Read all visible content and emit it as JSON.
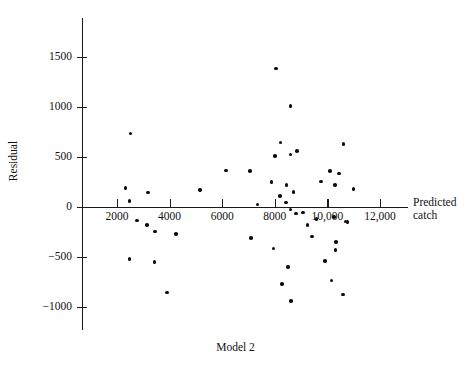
{
  "chart_data": {
    "type": "scatter",
    "title": "Model 2",
    "xlabel_line1": "Predicted",
    "xlabel_line2": "catch",
    "ylabel": "Residual",
    "xlim": [
      500,
      13000
    ],
    "ylim": [
      -1250,
      1700
    ],
    "grid": false,
    "legend": null,
    "xticks": [
      2000,
      4000,
      6000,
      8000,
      10000,
      12000
    ],
    "xtick_labels": [
      "2000",
      "4000",
      "6000",
      "8000",
      "10,000",
      "12,000"
    ],
    "yticks": [
      1500,
      1000,
      500,
      0,
      -500,
      -1000
    ],
    "ytick_labels": [
      "1500",
      "1000",
      "500",
      "0",
      "−500",
      "−1000"
    ],
    "points": [
      {
        "x": 2520,
        "y": 730
      },
      {
        "x": 2320,
        "y": 185
      },
      {
        "x": 2480,
        "y": 55
      },
      {
        "x": 3180,
        "y": 140
      },
      {
        "x": 5150,
        "y": 165
      },
      {
        "x": 2760,
        "y": -140
      },
      {
        "x": 3140,
        "y": -185
      },
      {
        "x": 3450,
        "y": -250
      },
      {
        "x": 4240,
        "y": -275
      },
      {
        "x": 2480,
        "y": -525
      },
      {
        "x": 3420,
        "y": -555
      },
      {
        "x": 3900,
        "y": -860
      },
      {
        "x": 6150,
        "y": 360
      },
      {
        "x": 7050,
        "y": 355
      },
      {
        "x": 7350,
        "y": 20
      },
      {
        "x": 7100,
        "y": -315
      },
      {
        "x": 8050,
        "y": 1380
      },
      {
        "x": 8600,
        "y": 1005
      },
      {
        "x": 8220,
        "y": 640
      },
      {
        "x": 8000,
        "y": 505
      },
      {
        "x": 8600,
        "y": 520
      },
      {
        "x": 8850,
        "y": 555
      },
      {
        "x": 7880,
        "y": 245
      },
      {
        "x": 8450,
        "y": 215
      },
      {
        "x": 8720,
        "y": 145
      },
      {
        "x": 8200,
        "y": 105
      },
      {
        "x": 8420,
        "y": 40
      },
      {
        "x": 8600,
        "y": -30
      },
      {
        "x": 8800,
        "y": -70
      },
      {
        "x": 7950,
        "y": -420
      },
      {
        "x": 8500,
        "y": -605
      },
      {
        "x": 8280,
        "y": -775
      },
      {
        "x": 8620,
        "y": -945
      },
      {
        "x": 9080,
        "y": -60
      },
      {
        "x": 9250,
        "y": -185
      },
      {
        "x": 9580,
        "y": -125
      },
      {
        "x": 9420,
        "y": -300
      },
      {
        "x": 9750,
        "y": 250
      },
      {
        "x": 10100,
        "y": 355
      },
      {
        "x": 10280,
        "y": 215
      },
      {
        "x": 10450,
        "y": 330
      },
      {
        "x": 10620,
        "y": 625
      },
      {
        "x": 11000,
        "y": 175
      },
      {
        "x": 10250,
        "y": -105
      },
      {
        "x": 10680,
        "y": -150
      },
      {
        "x": 10760,
        "y": -155
      },
      {
        "x": 10320,
        "y": -355
      },
      {
        "x": 10300,
        "y": -435
      },
      {
        "x": 9900,
        "y": -545
      },
      {
        "x": 10150,
        "y": -740
      },
      {
        "x": 10600,
        "y": -880
      }
    ]
  }
}
